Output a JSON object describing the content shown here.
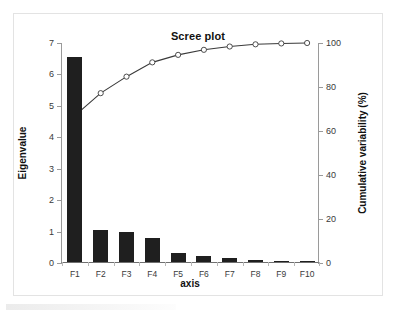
{
  "chart_data": {
    "type": "bar",
    "title": "Scree plot",
    "xlabel": "axis",
    "ylabel": "Eigenvalue",
    "y2label": "Cumulative variability (%)",
    "categories": [
      "F1",
      "F2",
      "F3",
      "F4",
      "F5",
      "F6",
      "F7",
      "F8",
      "F9",
      "F10"
    ],
    "series": [
      {
        "name": "Eigenvalue",
        "type": "bar",
        "axis": "left",
        "color": "#1f1f1f",
        "values": [
          6.53,
          1.01,
          0.95,
          0.78,
          0.29,
          0.2,
          0.12,
          0.05,
          0.02,
          0.01
        ]
      },
      {
        "name": "Cumulative variability (%)",
        "type": "line",
        "axis": "right",
        "color": "#3a3a3a",
        "marker": "open-circle",
        "values": [
          67.0,
          77.2,
          84.7,
          91.2,
          94.6,
          96.9,
          98.4,
          99.4,
          99.8,
          100.0
        ]
      }
    ],
    "ylim": [
      0,
      7
    ],
    "y2lim": [
      0,
      100
    ],
    "yticks": [
      0,
      1,
      2,
      3,
      4,
      5,
      6,
      7
    ],
    "y2ticks": [
      0,
      20,
      40,
      60,
      80,
      100
    ],
    "grid": false,
    "legend": "none"
  },
  "axes": {
    "left_tick_labels": [
      "0",
      "1",
      "2",
      "3",
      "4",
      "5",
      "6",
      "7"
    ],
    "right_tick_labels": [
      "0",
      "20",
      "40",
      "60",
      "80",
      "100"
    ]
  }
}
